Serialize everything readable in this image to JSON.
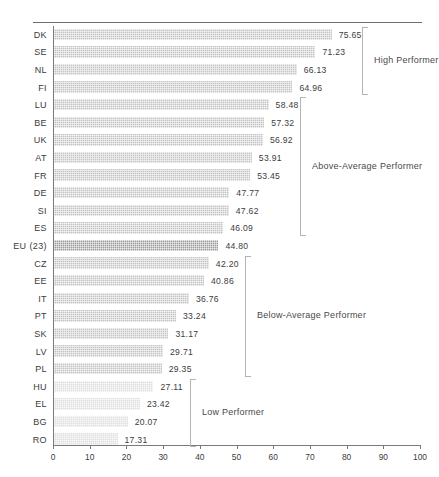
{
  "chart_data": {
    "type": "bar",
    "orientation": "horizontal",
    "title": "",
    "xlabel": "",
    "ylabel": "",
    "xlim": [
      0,
      100
    ],
    "xticks": [
      0,
      10,
      20,
      30,
      40,
      50,
      60,
      70,
      80,
      90,
      100
    ],
    "grid": false,
    "legend": "none",
    "categories": [
      "DK",
      "SE",
      "NL",
      "FI",
      "LU",
      "BE",
      "UK",
      "AT",
      "FR",
      "DE",
      "SI",
      "ES",
      "EU (23)",
      "CZ",
      "EE",
      "IT",
      "PT",
      "SK",
      "LV",
      "PL",
      "HU",
      "EL",
      "BG",
      "RO"
    ],
    "values": [
      75.65,
      71.23,
      66.13,
      64.96,
      58.48,
      57.32,
      56.92,
      53.91,
      53.45,
      47.77,
      47.62,
      46.09,
      44.8,
      42.2,
      40.86,
      36.76,
      33.24,
      31.17,
      29.71,
      29.35,
      27.11,
      23.42,
      20.07,
      17.31
    ],
    "value_labels": [
      "75.65",
      "71.23",
      "66.13",
      "64.96",
      "58.48",
      "57.32",
      "56.92",
      "53.91",
      "53.45",
      "47.77",
      "47.62",
      "46.09",
      "44.80",
      "42.20",
      "40.86",
      "36.76",
      "33.24",
      "31.17",
      "29.71",
      "29.35",
      "27.11",
      "23.42",
      "20.07",
      "17.31"
    ],
    "bar_shades": [
      "med",
      "med",
      "med",
      "med",
      "med",
      "med",
      "med",
      "med",
      "med",
      "med",
      "med",
      "med",
      "dark",
      "med",
      "med",
      "med",
      "med",
      "med",
      "med",
      "med",
      "light",
      "light",
      "light",
      "light"
    ],
    "annotations": [
      {
        "name": "high-performer",
        "label": "High Performer",
        "from_category": "DK",
        "to_category": "FI"
      },
      {
        "name": "above-average-performer",
        "label": "Above-Average Performer",
        "from_category": "LU",
        "to_category": "ES"
      },
      {
        "name": "below-average-performer",
        "label": "Below-Average Performer",
        "from_category": "CZ",
        "to_category": "PL"
      },
      {
        "name": "low-performer",
        "label": "Low Performer",
        "from_category": "HU",
        "to_category": "RO"
      }
    ],
    "colors": {
      "bar_medium": "#c4c4c4",
      "bar_dark": "#9a9a9a",
      "bar_light": "#dedede",
      "axis": "#7a7a7a",
      "text": "#3c3c3c",
      "bracket": "#b4b4b4"
    }
  },
  "caption_ghost": "· · · · ·· · · ·"
}
